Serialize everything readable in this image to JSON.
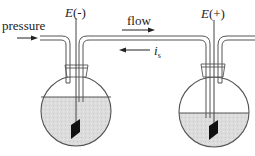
{
  "diagram": {
    "labels": {
      "pressure": "pressure",
      "electrode_left": "E(-)",
      "electrode_left_E": "E",
      "electrode_left_sign": "(-)",
      "electrode_right": "E(+)",
      "electrode_right_E": "E",
      "electrode_right_sign": "(+)",
      "flow": "flow",
      "current": "i",
      "current_sub": "s"
    },
    "colors": {
      "line": "#555555",
      "liquid": "#d9d9d9",
      "electrode": "#111111",
      "text": "#222222"
    }
  }
}
